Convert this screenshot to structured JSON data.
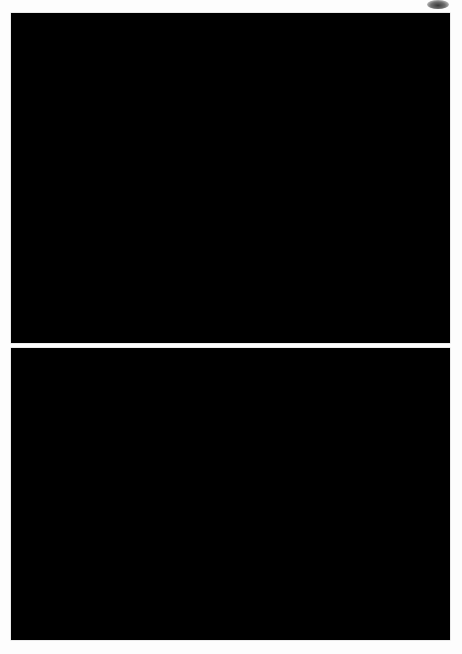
{
  "figure": {
    "type": "two-panel astronomical image figure",
    "background_color": "#fdfdfd",
    "width": 462,
    "height": 654,
    "artifact": {
      "name": "scan-smudge",
      "x": 427,
      "y": 0,
      "w": 22,
      "h": 9
    }
  },
  "panels": [
    {
      "id": "a",
      "label": "a",
      "x": 11,
      "y": 13,
      "w": 439,
      "h": 330,
      "background_color": "#000000",
      "description": "Optical starfield with bright stars and faint filamentary reflection nebulosity",
      "nebula_color": "#8d939c",
      "star_color": "#ffffff",
      "star_count": 1250,
      "bright_stars": [
        {
          "x": 227,
          "y": 128,
          "r": 11.5,
          "mag": "brightest"
        },
        {
          "x": 152,
          "y": 72,
          "r": 6.5,
          "mag": "bright"
        },
        {
          "x": 219,
          "y": 80,
          "r": 5.0,
          "mag": "bright"
        },
        {
          "x": 189,
          "y": 121,
          "r": 4.2,
          "mag": "bright"
        },
        {
          "x": 52,
          "y": 56,
          "r": 4.6,
          "mag": "bright"
        },
        {
          "x": 276,
          "y": 288,
          "r": 4.6,
          "mag": "bright"
        },
        {
          "x": 380,
          "y": 298,
          "r": 4.8,
          "mag": "bright"
        },
        {
          "x": 303,
          "y": 227,
          "r": 4.0,
          "mag": "bright"
        },
        {
          "x": 117,
          "y": 253,
          "r": 3.8,
          "mag": "bright"
        },
        {
          "x": 118,
          "y": 315,
          "r": 3.6,
          "mag": "bright"
        },
        {
          "x": 398,
          "y": 263,
          "r": 3.6,
          "mag": "bright"
        },
        {
          "x": 405,
          "y": 315,
          "r": 3.4,
          "mag": "bright"
        },
        {
          "x": 34,
          "y": 39,
          "r": 3.0,
          "mag": "bright"
        },
        {
          "x": 388,
          "y": 59,
          "r": 3.4,
          "mag": "bright"
        },
        {
          "x": 313,
          "y": 170,
          "r": 3.2,
          "mag": "bright"
        }
      ],
      "nebula_blobs": [
        {
          "x": 232,
          "y": 135,
          "rx": 62,
          "ry": 46,
          "rot": -18,
          "alpha": 0.26
        },
        {
          "x": 185,
          "y": 108,
          "rx": 48,
          "ry": 30,
          "rot": 28,
          "alpha": 0.17
        },
        {
          "x": 150,
          "y": 140,
          "rx": 52,
          "ry": 34,
          "rot": -38,
          "alpha": 0.14
        },
        {
          "x": 275,
          "y": 155,
          "rx": 66,
          "ry": 32,
          "rot": -8,
          "alpha": 0.15
        },
        {
          "x": 200,
          "y": 190,
          "rx": 72,
          "ry": 40,
          "rot": 12,
          "alpha": 0.1
        },
        {
          "x": 110,
          "y": 170,
          "rx": 44,
          "ry": 26,
          "rot": -55,
          "alpha": 0.09
        }
      ],
      "filaments": [
        {
          "points": "96,130 126,118 150,104 172,88 196,72 214,62",
          "w": 2.6,
          "alpha": 0.3
        },
        {
          "points": "104,160 140,146 168,128 190,110 210,92 226,80",
          "w": 2.2,
          "alpha": 0.24
        },
        {
          "points": "118,186 150,176 178,160 200,146 218,132",
          "w": 2.0,
          "alpha": 0.2
        },
        {
          "points": "140,214 168,200 190,184 208,168",
          "w": 1.8,
          "alpha": 0.18
        },
        {
          "points": "232,84 244,104 252,128 256,152 252,176",
          "w": 2.0,
          "alpha": 0.2
        },
        {
          "points": "258,148 282,150 304,146 322,138 334,128",
          "w": 2.2,
          "alpha": 0.22
        },
        {
          "points": "246,170 268,180 290,184 312,182",
          "w": 1.8,
          "alpha": 0.17
        },
        {
          "points": "176,152 200,158 220,158 236,152",
          "w": 1.6,
          "alpha": 0.15
        }
      ]
    },
    {
      "id": "b",
      "label": "b",
      "x": 11,
      "y": 348,
      "w": 439,
      "h": 292,
      "background_color": "#000000",
      "description": "Deeper starfield image with diffuse extended emission nebula",
      "nebula_color": "#6f7480",
      "star_color": "#e8e8e8",
      "star_count": 2300,
      "bright_stars": [
        {
          "x": 155,
          "y": 165,
          "r": 4.4,
          "mag": "bright"
        },
        {
          "x": 167,
          "y": 195,
          "r": 5.2,
          "mag": "brightest"
        },
        {
          "x": 122,
          "y": 160,
          "r": 2.8,
          "mag": "bright"
        },
        {
          "x": 186,
          "y": 112,
          "r": 2.8,
          "mag": "bright"
        },
        {
          "x": 282,
          "y": 109,
          "r": 2.9,
          "mag": "bright"
        },
        {
          "x": 66,
          "y": 239,
          "r": 2.8,
          "mag": "bright"
        },
        {
          "x": 99,
          "y": 272,
          "r": 2.8,
          "mag": "bright"
        },
        {
          "x": 340,
          "y": 96,
          "r": 2.6,
          "mag": "bright"
        },
        {
          "x": 61,
          "y": 59,
          "r": 2.4,
          "mag": "bright"
        },
        {
          "x": 418,
          "y": 175,
          "r": 2.4,
          "mag": "bright"
        },
        {
          "x": 218,
          "y": 250,
          "r": 2.6,
          "mag": "bright"
        }
      ],
      "nebula_blobs": [
        {
          "x": 166,
          "y": 180,
          "rx": 72,
          "ry": 66,
          "rot": 10,
          "alpha": 0.26
        },
        {
          "x": 200,
          "y": 140,
          "rx": 98,
          "ry": 72,
          "rot": -12,
          "alpha": 0.15
        },
        {
          "x": 250,
          "y": 170,
          "rx": 112,
          "ry": 86,
          "rot": 6,
          "alpha": 0.1
        },
        {
          "x": 140,
          "y": 220,
          "rx": 74,
          "ry": 54,
          "rot": 22,
          "alpha": 0.12
        },
        {
          "x": 300,
          "y": 120,
          "rx": 84,
          "ry": 58,
          "rot": -20,
          "alpha": 0.07
        },
        {
          "x": 190,
          "y": 250,
          "rx": 90,
          "ry": 50,
          "rot": 0,
          "alpha": 0.08
        }
      ],
      "filaments": [
        {
          "points": "128,150 150,162 166,176 180,192 190,210",
          "w": 2.0,
          "alpha": 0.18
        },
        {
          "points": "112,188 134,186 156,190 176,200 192,214",
          "w": 1.8,
          "alpha": 0.16
        },
        {
          "points": "144,126 152,146 158,166 160,186",
          "w": 1.6,
          "alpha": 0.15
        },
        {
          "points": "186,160 204,156 222,158 238,166",
          "w": 1.6,
          "alpha": 0.12
        },
        {
          "points": "120,230 146,224 170,222 192,226",
          "w": 1.6,
          "alpha": 0.12
        }
      ]
    }
  ]
}
